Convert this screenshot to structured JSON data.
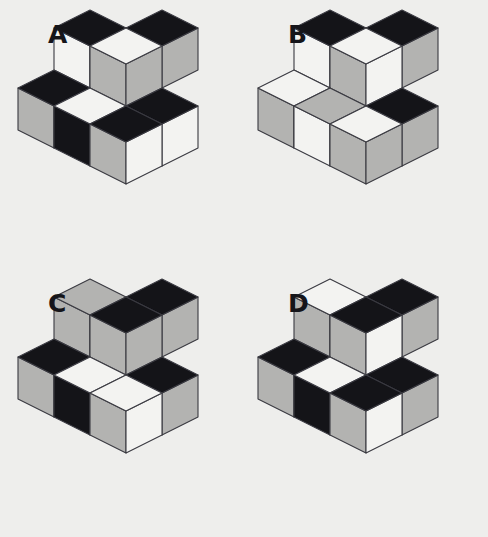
{
  "page": {
    "background_color": "#eeeeec",
    "width": 488,
    "height": 537,
    "panel_count": 4
  },
  "palette": {
    "dark": "#141418",
    "light": "#f3f3f1",
    "gray": "#b3b3b1",
    "outline": "#3a3a40",
    "label_color": "#15151a",
    "background": "#eeeeec"
  },
  "geometry": {
    "cube_half_width": 36,
    "cube_height": 42,
    "note": "isometric projection, top face is a rhombus, left and right faces are parallelograms"
  },
  "panels": [
    {
      "id": "panel-a",
      "label": "A",
      "label_x": 48,
      "label_y": 22,
      "origin_x": 20,
      "origin_y": 34,
      "cubes": [
        {
          "name": "back-top",
          "col": 1,
          "row": -1,
          "lvl": 1,
          "top": "dark",
          "left": "light",
          "right": "gray"
        },
        {
          "name": "back-left",
          "col": 0,
          "row": 0,
          "lvl": 1,
          "top": "dark",
          "left": "light",
          "right": "gray"
        },
        {
          "name": "center-upper",
          "col": 1,
          "row": 0,
          "lvl": 1,
          "top": "light",
          "left": "gray",
          "right": "gray"
        },
        {
          "name": "right-mid",
          "col": 2,
          "row": 0,
          "lvl": 0,
          "top": "dark",
          "left": "gray",
          "right": "light"
        },
        {
          "name": "front-left",
          "col": 0,
          "row": 1,
          "lvl": 0,
          "top": "dark",
          "left": "gray",
          "right": "gray"
        },
        {
          "name": "front-center",
          "col": 1,
          "row": 1,
          "lvl": 0,
          "top": "light",
          "left": "dark",
          "right": "gray"
        },
        {
          "name": "front-right",
          "col": 2,
          "row": 1,
          "lvl": 0,
          "top": "dark",
          "left": "gray",
          "right": "light"
        }
      ]
    },
    {
      "id": "panel-b",
      "label": "B",
      "label_x": 44,
      "label_y": 22,
      "origin_x": 16,
      "origin_y": 34,
      "cubes": [
        {
          "name": "back-top",
          "col": 1,
          "row": -1,
          "lvl": 1,
          "top": "dark",
          "left": "light",
          "right": "gray"
        },
        {
          "name": "back-left",
          "col": 0,
          "row": 0,
          "lvl": 1,
          "top": "dark",
          "left": "light",
          "right": "gray"
        },
        {
          "name": "center-upper",
          "col": 1,
          "row": 0,
          "lvl": 1,
          "top": "light",
          "left": "gray",
          "right": "light"
        },
        {
          "name": "right-mid",
          "col": 2,
          "row": 0,
          "lvl": 0,
          "top": "dark",
          "left": "dark",
          "right": "gray"
        },
        {
          "name": "front-left",
          "col": 0,
          "row": 1,
          "lvl": 0,
          "top": "light",
          "left": "gray",
          "right": "dark"
        },
        {
          "name": "front-center",
          "col": 1,
          "row": 1,
          "lvl": 0,
          "top": "gray",
          "left": "light",
          "right": "light"
        },
        {
          "name": "front-right",
          "col": 2,
          "row": 1,
          "lvl": 0,
          "top": "light",
          "left": "gray",
          "right": "gray"
        }
      ]
    },
    {
      "id": "panel-c",
      "label": "C",
      "label_x": 48,
      "label_y": 22,
      "origin_x": 20,
      "origin_y": 34,
      "cubes": [
        {
          "name": "back-top",
          "col": 1,
          "row": -1,
          "lvl": 1,
          "top": "dark",
          "left": "light",
          "right": "gray"
        },
        {
          "name": "back-left",
          "col": 0,
          "row": 0,
          "lvl": 1,
          "top": "gray",
          "left": "gray",
          "right": "dark"
        },
        {
          "name": "center-upper",
          "col": 1,
          "row": 0,
          "lvl": 1,
          "top": "dark",
          "left": "gray",
          "right": "gray"
        },
        {
          "name": "right-mid",
          "col": 2,
          "row": 0,
          "lvl": 0,
          "top": "dark",
          "left": "gray",
          "right": "gray"
        },
        {
          "name": "front-left",
          "col": 0,
          "row": 1,
          "lvl": 0,
          "top": "dark",
          "left": "gray",
          "right": "gray"
        },
        {
          "name": "front-center",
          "col": 1,
          "row": 1,
          "lvl": 0,
          "top": "light",
          "left": "dark",
          "right": "gray"
        },
        {
          "name": "front-right",
          "col": 2,
          "row": 1,
          "lvl": 0,
          "top": "light",
          "left": "gray",
          "right": "light"
        }
      ]
    },
    {
      "id": "panel-d",
      "label": "D",
      "label_x": 44,
      "label_y": 22,
      "origin_x": 16,
      "origin_y": 34,
      "cubes": [
        {
          "name": "back-top",
          "col": 1,
          "row": -1,
          "lvl": 1,
          "top": "dark",
          "left": "gray",
          "right": "gray"
        },
        {
          "name": "back-left",
          "col": 0,
          "row": 0,
          "lvl": 1,
          "top": "light",
          "left": "gray",
          "right": "dark"
        },
        {
          "name": "center-upper",
          "col": 1,
          "row": 0,
          "lvl": 1,
          "top": "dark",
          "left": "gray",
          "right": "light"
        },
        {
          "name": "right-mid",
          "col": 2,
          "row": 0,
          "lvl": 0,
          "top": "dark",
          "left": "light",
          "right": "gray"
        },
        {
          "name": "front-left",
          "col": 0,
          "row": 1,
          "lvl": 0,
          "top": "dark",
          "left": "gray",
          "right": "gray"
        },
        {
          "name": "front-center",
          "col": 1,
          "row": 1,
          "lvl": 0,
          "top": "light",
          "left": "dark",
          "right": "gray"
        },
        {
          "name": "front-right",
          "col": 2,
          "row": 1,
          "lvl": 0,
          "top": "dark",
          "left": "gray",
          "right": "light"
        }
      ]
    }
  ]
}
